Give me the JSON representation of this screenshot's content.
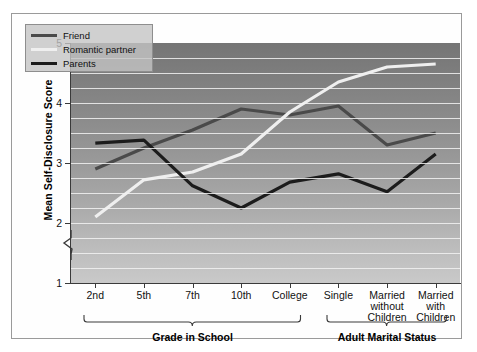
{
  "chart_data": {
    "type": "line",
    "title": "",
    "xlabel": "",
    "ylabel": "Mean Self-Disclosure Score",
    "ylim": [
      1,
      5
    ],
    "yticks": [
      1,
      2,
      3,
      4,
      5
    ],
    "ytick_labels": [
      "1",
      "2",
      "3",
      "4",
      "5"
    ],
    "y_axis_break": true,
    "y_axis_break_between": [
      1,
      2
    ],
    "grid": true,
    "grid_interval": 0.25,
    "legend_position": "top-left",
    "categories": [
      "2nd",
      "5th",
      "7th",
      "10th",
      "College",
      "Single",
      "Married without Children",
      "Married with Children"
    ],
    "category_lines": [
      [
        "2nd"
      ],
      [
        "5th"
      ],
      [
        "7th"
      ],
      [
        "10th"
      ],
      [
        "College"
      ],
      [
        "Single"
      ],
      [
        "Married",
        "without",
        "Children"
      ],
      [
        "Married",
        "with",
        "Children"
      ]
    ],
    "series": [
      {
        "name": "Friend",
        "color": "#4a4a4a",
        "values": [
          2.9,
          3.25,
          3.55,
          3.9,
          3.8,
          3.95,
          3.3,
          3.5
        ]
      },
      {
        "name": "Romantic partner",
        "color": "#efefef",
        "values": [
          2.1,
          2.72,
          2.85,
          3.15,
          3.85,
          4.35,
          4.6,
          4.65
        ]
      },
      {
        "name": "Parents",
        "color": "#1c1c1c",
        "values": [
          3.33,
          3.38,
          2.62,
          2.25,
          2.68,
          2.82,
          2.52,
          3.15
        ]
      }
    ],
    "groups": [
      {
        "label": "Grade in School",
        "from": 0,
        "to": 4
      },
      {
        "label": "Adult Marital Status",
        "from": 5,
        "to": 7
      }
    ],
    "colors": {
      "plot_top": "#757575",
      "plot_bottom": "#c9c9c9",
      "gridline": "#f2f2f2",
      "axis": "#3a3a3a",
      "text": "#111111",
      "legend_bg": "#c4c4c4",
      "frame": "#9a9a9a",
      "page_bg": "#ffffff"
    }
  }
}
